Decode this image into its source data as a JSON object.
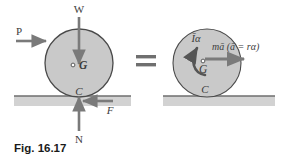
{
  "figure": {
    "caption": "Fig. 16.17",
    "equality_sign": "=",
    "colors": {
      "disk_fill": "#c9c9c9",
      "disk_stroke": "#4a4a4a",
      "ground_fill": "#d2d2d2",
      "ground_line": "#6e6e6e",
      "arrow": "#7a7a7a",
      "label": "#3c3c3c",
      "caption": "#1a1a1a",
      "background": "#ffffff"
    }
  },
  "left_diagram": {
    "name": "free-body-diagram",
    "labels": {
      "weight": "W",
      "applied_force": "P",
      "center_of_mass": "G",
      "contact_point": "C",
      "friction": "F",
      "normal_force": "N"
    },
    "forces": [
      {
        "symbol": "W",
        "direction": "down",
        "description": "weight at center"
      },
      {
        "symbol": "P",
        "direction": "right",
        "description": "applied horizontal force"
      },
      {
        "symbol": "F",
        "direction": "left",
        "description": "friction force at contact"
      },
      {
        "symbol": "N",
        "direction": "up",
        "description": "normal reaction at contact"
      }
    ]
  },
  "right_diagram": {
    "name": "effective-force-diagram",
    "labels": {
      "angular_inertia_couple": "Īα",
      "linear_inertia_vector": "mā",
      "kinematic_relation": "(ā = rα)",
      "center_of_mass": "G",
      "contact_point": "C"
    },
    "effective_forces": [
      {
        "symbol": "Īα",
        "direction": "counterclockwise",
        "description": "inertia couple about mass center"
      },
      {
        "symbol": "mā",
        "direction": "right",
        "description": "inertia vector at mass center"
      }
    ]
  }
}
